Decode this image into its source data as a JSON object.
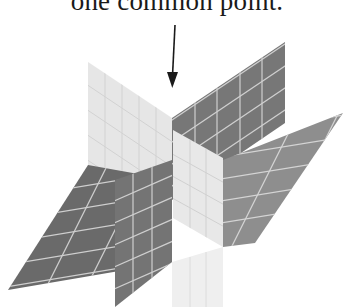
{
  "figure": {
    "caption": "one common point.",
    "arrow": {
      "label_target": "common-point",
      "from": [
        175,
        25
      ],
      "to": [
        172,
        86
      ]
    },
    "colors": {
      "background": "#ffffff",
      "text": "#1a1a1a",
      "dark_plane": "#6e6e6e",
      "mid_plane": "#8c8c8c",
      "light_plane": "#e4e4e4",
      "grid_line": "#d8d8d8",
      "arrow": "#1a1a1a"
    },
    "planes": [
      {
        "name": "vertical-dark-plane",
        "shade": "dark"
      },
      {
        "name": "vertical-light-plane",
        "shade": "light"
      },
      {
        "name": "horizontal-plane",
        "shade": "mid"
      }
    ]
  }
}
